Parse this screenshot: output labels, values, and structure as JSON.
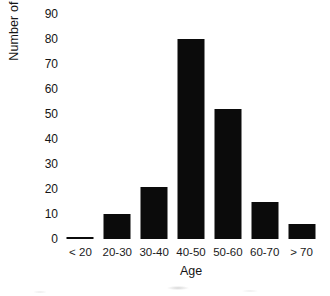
{
  "chart_data": {
    "type": "bar",
    "title": "",
    "xlabel": "Age",
    "ylabel": "Number of patients",
    "categories": [
      "< 20",
      "20-30",
      "30-40",
      "40-50",
      "50-60",
      "60-70",
      "> 70"
    ],
    "values": [
      1,
      10,
      21,
      80,
      52,
      15,
      6
    ],
    "ylim": [
      0,
      90
    ],
    "yticks": [
      0,
      10,
      20,
      30,
      40,
      50,
      60,
      70,
      80,
      90
    ],
    "ytick_labels": [
      "0",
      "10",
      "20",
      "30",
      "40",
      "50",
      "60",
      "70",
      "80",
      "90"
    ],
    "grid": false,
    "legend": null,
    "bar_color": "#0b0b0b",
    "background_color": "#ffffff"
  }
}
